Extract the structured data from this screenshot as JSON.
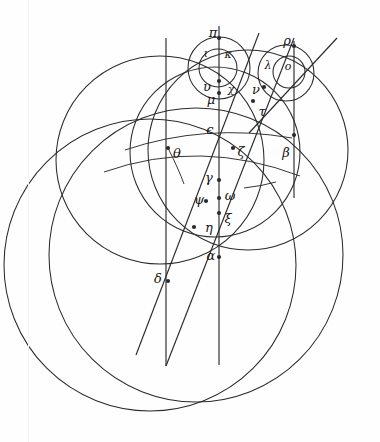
{
  "figure": {
    "background_color": "#fefefe",
    "ink_color": "#2b2b2b",
    "width": 380,
    "height": 442
  },
  "labels": [
    {
      "id": "pi",
      "glyph": "π",
      "x": 213,
      "y": 33,
      "size": "normal"
    },
    {
      "id": "rho",
      "glyph": "ρ",
      "x": 287,
      "y": 41,
      "size": "normal"
    },
    {
      "id": "iota",
      "glyph": "ι",
      "x": 206,
      "y": 54,
      "size": "small"
    },
    {
      "id": "kappa",
      "glyph": "κ",
      "x": 228,
      "y": 55,
      "size": "small"
    },
    {
      "id": "lambda",
      "glyph": "λ",
      "x": 268,
      "y": 66,
      "size": "small"
    },
    {
      "id": "omicron",
      "glyph": "ο",
      "x": 288,
      "y": 67,
      "size": "small"
    },
    {
      "id": "upsilon",
      "glyph": "υ",
      "x": 207,
      "y": 87,
      "size": "normal"
    },
    {
      "id": "chi",
      "glyph": "χ",
      "x": 231,
      "y": 90,
      "size": "small"
    },
    {
      "id": "nu",
      "glyph": "ν",
      "x": 256,
      "y": 90,
      "size": "normal"
    },
    {
      "id": "mu",
      "glyph": "μ",
      "x": 211,
      "y": 100,
      "size": "normal"
    },
    {
      "id": "tau",
      "glyph": "τ",
      "x": 262,
      "y": 112,
      "size": "normal"
    },
    {
      "id": "epsilon",
      "glyph": "ϵ",
      "x": 210,
      "y": 130,
      "size": "normal"
    },
    {
      "id": "theta",
      "glyph": "θ",
      "x": 177,
      "y": 154,
      "size": "normal"
    },
    {
      "id": "zeta",
      "glyph": "ζ",
      "x": 241,
      "y": 152,
      "size": "normal"
    },
    {
      "id": "beta",
      "glyph": "β",
      "x": 286,
      "y": 153,
      "size": "normal"
    },
    {
      "id": "gamma",
      "glyph": "γ",
      "x": 209,
      "y": 178,
      "size": "normal"
    },
    {
      "id": "omega",
      "glyph": "ω",
      "x": 230,
      "y": 196,
      "size": "normal"
    },
    {
      "id": "psi",
      "glyph": "ψ",
      "x": 199,
      "y": 200,
      "size": "normal"
    },
    {
      "id": "xi",
      "glyph": "ξ",
      "x": 228,
      "y": 219,
      "size": "normal"
    },
    {
      "id": "eta",
      "glyph": "η",
      "x": 209,
      "y": 228,
      "size": "normal"
    },
    {
      "id": "alpha",
      "glyph": "α",
      "x": 211,
      "y": 256,
      "size": "normal"
    },
    {
      "id": "delta",
      "glyph": "δ",
      "x": 158,
      "y": 279,
      "size": "normal"
    }
  ],
  "node_points": [
    {
      "id": "point-pi",
      "x": 219,
      "y": 38
    },
    {
      "id": "point-rho",
      "x": 294,
      "y": 46
    },
    {
      "id": "point-upsilon",
      "x": 219,
      "y": 81
    },
    {
      "id": "point-mu",
      "x": 219,
      "y": 93
    },
    {
      "id": "point-nu",
      "x": 264,
      "y": 87
    },
    {
      "id": "point-tau",
      "x": 253,
      "y": 101
    },
    {
      "id": "point-theta",
      "x": 168,
      "y": 148
    },
    {
      "id": "point-zeta",
      "x": 233,
      "y": 148
    },
    {
      "id": "point-beta",
      "x": 294,
      "y": 135
    },
    {
      "id": "point-gamma",
      "x": 219,
      "y": 180
    },
    {
      "id": "point-psi",
      "x": 206,
      "y": 201
    },
    {
      "id": "point-omega",
      "x": 219,
      "y": 198
    },
    {
      "id": "point-xi",
      "x": 219,
      "y": 213
    },
    {
      "id": "point-eta",
      "x": 194,
      "y": 227
    },
    {
      "id": "point-alpha",
      "x": 219,
      "y": 257
    },
    {
      "id": "point-delta",
      "x": 168,
      "y": 281
    }
  ],
  "circles": [
    {
      "id": "circle-big-left",
      "cx": 150,
      "cy": 265,
      "r": 146
    },
    {
      "id": "circle-big-right",
      "cx": 196,
      "cy": 255,
      "r": 147
    },
    {
      "id": "circle-upper-left",
      "cx": 160,
      "cy": 160,
      "r": 104
    },
    {
      "id": "circle-upper-right",
      "cx": 248,
      "cy": 150,
      "r": 100
    },
    {
      "id": "circle-mid",
      "cx": 215,
      "cy": 152,
      "r": 85
    },
    {
      "id": "circle-small-pi",
      "cx": 219,
      "cy": 68,
      "r": 31
    },
    {
      "id": "circle-small-rho",
      "cx": 286,
      "cy": 73,
      "r": 28
    },
    {
      "id": "circle-tiny-pi",
      "cx": 218,
      "cy": 68,
      "r": 19
    },
    {
      "id": "circle-tiny-rho",
      "cx": 289,
      "cy": 72,
      "r": 16
    }
  ],
  "straight_lines": [
    {
      "id": "vertical-left",
      "x1": 166,
      "y1": 38,
      "x2": 166,
      "y2": 366
    },
    {
      "id": "vertical-right",
      "x1": 219,
      "y1": 26,
      "x2": 219,
      "y2": 365
    },
    {
      "id": "vertical-far-right",
      "x1": 294,
      "y1": 41,
      "x2": 294,
      "y2": 198
    },
    {
      "id": "diagonal-outer",
      "x1": 136,
      "y1": 355,
      "x2": 259,
      "y2": 33
    },
    {
      "id": "diagonal-inner",
      "x1": 166,
      "y1": 366,
      "x2": 294,
      "y2": 38
    },
    {
      "id": "diagonal-right",
      "x1": 249,
      "y1": 133,
      "x2": 337,
      "y2": 38
    }
  ]
}
